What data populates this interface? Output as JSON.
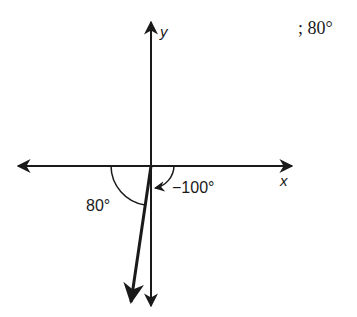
{
  "diagram": {
    "type": "angle-on-coordinate-axes",
    "answer_text": "; 80°",
    "axes": {
      "x_label": "x",
      "y_label": "y"
    },
    "angles": [
      {
        "label": "80°",
        "description": "reference angle measured from negative x-axis to the vector"
      },
      {
        "label": "−100°",
        "description": "angle measured clockwise from positive x-axis to the vector"
      }
    ],
    "vector": {
      "direction_degrees": -100,
      "quadrant": "III"
    },
    "colors": {
      "stroke": "#1a1a1a",
      "background": "#ffffff"
    }
  }
}
